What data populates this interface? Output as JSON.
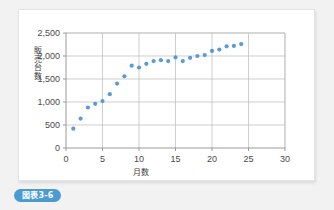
{
  "caption": {
    "label": "図表3-6",
    "color": "#4a9ad4"
  },
  "chart_data": {
    "type": "scatter",
    "title": "",
    "xlabel": "月数",
    "ylabel": "販売台数",
    "xlim": [
      0,
      30
    ],
    "ylim": [
      0,
      2500
    ],
    "xticks": [
      0,
      5,
      10,
      15,
      20,
      25,
      30
    ],
    "yticks": [
      0,
      500,
      1000,
      1500,
      2000,
      2500
    ],
    "xticklabels": [
      "0",
      "5",
      "10",
      "15",
      "20",
      "25",
      "30"
    ],
    "yticklabels": [
      "0",
      "500",
      "1,000",
      "1,500",
      "2,000",
      "2,500"
    ],
    "grid": true,
    "legend": false,
    "marker_color": "#5b9bd5",
    "x": [
      1,
      2,
      3,
      4,
      5,
      6,
      7,
      8,
      9,
      10,
      11,
      12,
      13,
      14,
      15,
      16,
      17,
      18,
      19,
      20,
      21,
      22,
      23,
      24
    ],
    "y": [
      420,
      640,
      880,
      960,
      1020,
      1170,
      1400,
      1560,
      1790,
      1750,
      1830,
      1890,
      1910,
      1890,
      1970,
      1890,
      1960,
      2000,
      2020,
      2110,
      2140,
      2210,
      2220,
      2260
    ],
    "series": [
      {
        "name": "販売台数",
        "values": [
          420,
          640,
          880,
          960,
          1020,
          1170,
          1400,
          1560,
          1790,
          1750,
          1830,
          1890,
          1910,
          1890,
          1970,
          1890,
          1960,
          2000,
          2020,
          2110,
          2140,
          2210,
          2220,
          2260
        ]
      }
    ]
  }
}
